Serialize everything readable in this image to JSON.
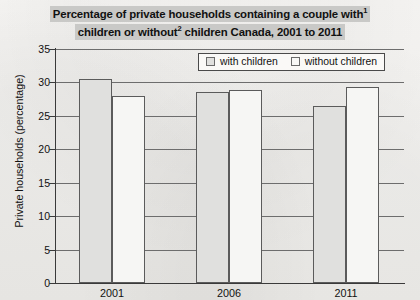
{
  "chart_data": {
    "type": "bar",
    "title": "Percentage of private households containing a couple with1 children or without2 children Canada, 2001 to 2011",
    "title_line1_pre": "Percentage of private households containing a couple with",
    "title_line1_sup": "1",
    "title_line2_pre": "children or without",
    "title_line2_sup": "2",
    "title_line2_post": " children Canada, 2001 to 2011",
    "categories": [
      "2001",
      "2006",
      "2011"
    ],
    "series": [
      {
        "name": "with children",
        "values": [
          30.5,
          28.5,
          26.5
        ]
      },
      {
        "name": "without children",
        "values": [
          27.9,
          28.8,
          29.3
        ]
      }
    ],
    "xlabel": "",
    "ylabel": "Private households (percentage)",
    "ylim": [
      0,
      35
    ],
    "yticks": [
      0,
      5,
      10,
      15,
      20,
      25,
      30,
      35
    ],
    "grid": true,
    "legend_position": "top-right",
    "colors": {
      "with_children_fill": "#e0e0de",
      "without_children_fill": "#f6f6f4",
      "bar_border": "#5b5b5b",
      "axis": "#3a3a3a",
      "gridline": "#6d6d6d",
      "title_highlight": "#c9c9c7",
      "background": "#f3f2f0"
    }
  },
  "legend": {
    "items": [
      {
        "label": "with children"
      },
      {
        "label": "without children"
      }
    ]
  }
}
